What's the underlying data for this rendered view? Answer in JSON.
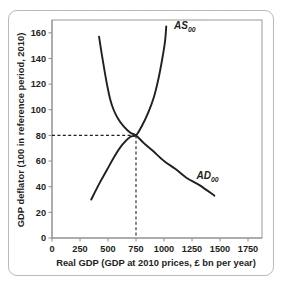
{
  "chart_data": {
    "type": "line",
    "title": "",
    "xlabel": "Real GDP (GDP at 2010 prices, £ bn per year)",
    "ylabel": "GDP deflator (100 in reference period, 2010)",
    "xlim": [
      0,
      1875
    ],
    "ylim": [
      0,
      170
    ],
    "xticks": [
      0,
      250,
      500,
      750,
      1000,
      1250,
      1500,
      1750
    ],
    "xtick_labels": [
      "0",
      "250",
      "500",
      "750",
      "1000",
      "1250",
      "1500",
      "1750"
    ],
    "yticks": [
      0,
      20,
      40,
      60,
      80,
      100,
      120,
      140,
      160
    ],
    "ytick_labels": [
      "0",
      "20",
      "40",
      "60",
      "80",
      "100",
      "120",
      "140",
      "160"
    ],
    "grid": false,
    "legend_position": "inline-curve-labels",
    "series": [
      {
        "name": "AS00",
        "label_text": "AS",
        "label_sub": "00",
        "label_x": 1090,
        "label_y": 163,
        "description": "Aggregate supply curve, upward sloping and convex, steepening at higher real GDP",
        "points": [
          [
            350,
            30
          ],
          [
            420,
            42
          ],
          [
            490,
            53
          ],
          [
            560,
            64
          ],
          [
            630,
            73
          ],
          [
            700,
            79
          ],
          [
            750,
            80
          ],
          [
            800,
            87
          ],
          [
            860,
            98
          ],
          [
            910,
            110
          ],
          [
            950,
            124
          ],
          [
            985,
            140
          ],
          [
            1010,
            154
          ],
          [
            1020,
            165
          ]
        ]
      },
      {
        "name": "AD00",
        "label_text": "AD",
        "label_sub": "00",
        "label_x": 1290,
        "label_y": 46,
        "description": "Aggregate demand curve, downward sloping and convex, flattening at higher real GDP",
        "points": [
          [
            420,
            157
          ],
          [
            445,
            143
          ],
          [
            470,
            130
          ],
          [
            495,
            118
          ],
          [
            520,
            108
          ],
          [
            550,
            100
          ],
          [
            590,
            93
          ],
          [
            640,
            87
          ],
          [
            700,
            82
          ],
          [
            750,
            80
          ],
          [
            820,
            74
          ],
          [
            900,
            68
          ],
          [
            1000,
            60
          ],
          [
            1100,
            54
          ],
          [
            1200,
            47
          ],
          [
            1320,
            41
          ],
          [
            1450,
            33
          ]
        ]
      }
    ],
    "annotations": [
      {
        "name": "equilibrium",
        "x": 750,
        "y": 80,
        "guide_lines": [
          "horizontal-to-y-axis",
          "vertical-to-x-axis"
        ],
        "style": "dashed"
      }
    ],
    "colors": {
      "curve": "#231f20",
      "axis": "#8c8c8e",
      "frame": "#9a9a9c",
      "card_border": "#b9b9bb",
      "background": "#ffffff"
    }
  }
}
